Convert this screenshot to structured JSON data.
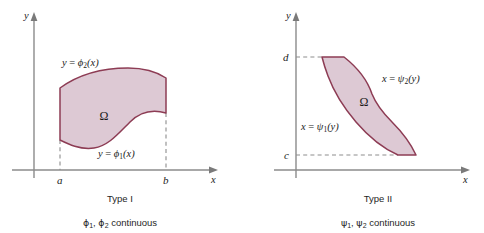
{
  "figure": {
    "background_color": "#ffffff",
    "region_fill_color": "#ddc9d4",
    "region_stroke_color": "#8d3c54",
    "axis_color": "#8b8b8b",
    "dash_color": "#8d8d8d"
  },
  "panels": [
    {
      "id": "type-i",
      "axes": {
        "y_label": "y",
        "x_label": "x"
      },
      "ticks": [
        {
          "name": "a",
          "label": "a",
          "axis": "x"
        },
        {
          "name": "b",
          "label": "b",
          "axis": "x"
        }
      ],
      "curves": [
        {
          "name": "upper-boundary",
          "label_prefix": "y = ",
          "fn": "ϕ",
          "sub": "2",
          "arg": "(x)"
        },
        {
          "name": "lower-boundary",
          "label_prefix": "y = ",
          "fn": "ϕ",
          "sub": "1",
          "arg": "(x)"
        }
      ],
      "region_symbol": "Ω",
      "title": "Type I",
      "subtitle_parts": {
        "fn1": "ϕ",
        "sub1": "1",
        "sep": ", ",
        "fn2": "ϕ",
        "sub2": "2",
        "tail": " continuous"
      },
      "subtitle_text": "ϕ₁, ϕ₂ continuous"
    },
    {
      "id": "type-ii",
      "axes": {
        "y_label": "y",
        "x_label": "x"
      },
      "ticks": [
        {
          "name": "d",
          "label": "d",
          "axis": "y"
        },
        {
          "name": "c",
          "label": "c",
          "axis": "y"
        }
      ],
      "curves": [
        {
          "name": "right-boundary",
          "label_prefix": "x = ",
          "fn": "ψ",
          "sub": "2",
          "arg": "(y)"
        },
        {
          "name": "left-boundary",
          "label_prefix": "x = ",
          "fn": "ψ",
          "sub": "1",
          "arg": "(y)"
        }
      ],
      "region_symbol": "Ω",
      "title": "Type II",
      "subtitle_parts": {
        "fn1": "ψ",
        "sub1": "1",
        "sep": ", ",
        "fn2": "ψ",
        "sub2": "2",
        "tail": " continuous"
      },
      "subtitle_text": "ψ₁, ψ₂ continuous"
    }
  ]
}
